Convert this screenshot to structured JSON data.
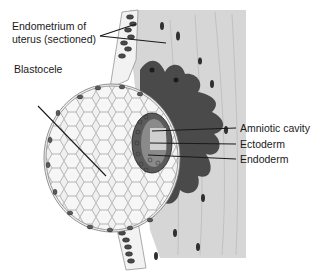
{
  "diagram": {
    "type": "anatomical-illustration",
    "colors": {
      "background": "#ffffff",
      "endometrium_stroma": "#d6d6d6",
      "trophoblast_dark": "#4a4a4a",
      "blastocele_cells": "#f4f4f4",
      "cell_outline": "#8a8a8a",
      "nuclei": "#3a3a3a",
      "label_text": "#1a1a1a"
    },
    "labels": {
      "endometrium_line1": "Endometrium of",
      "endometrium_line2": "uterus (sectioned)",
      "blastocele": "Blastocele",
      "amniotic_cavity": "Amniotic cavity",
      "ectoderm": "Ectoderm",
      "endoderm": "Endoderm"
    }
  }
}
